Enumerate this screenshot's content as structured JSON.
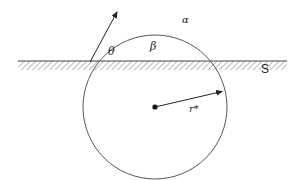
{
  "diagram": {
    "title": "",
    "labels": {
      "theta": "θ",
      "beta": "β",
      "alpha": "α",
      "surface": "S",
      "radius": "r*"
    },
    "surface": {
      "x1": 18,
      "x2": 287,
      "y": 61,
      "thickness": 9
    },
    "circle": {
      "cx": 155,
      "cy": 107,
      "r": 72
    },
    "tangent_arrow": {
      "x1": 90,
      "y1": 62,
      "x2": 118,
      "y2": 10
    },
    "radius_arrow": {
      "x1": 155,
      "y1": 107,
      "x2": 224,
      "y2": 91
    },
    "colors": {
      "stroke": "#333333",
      "hatch": "#555555",
      "background": "#ffffff"
    }
  }
}
